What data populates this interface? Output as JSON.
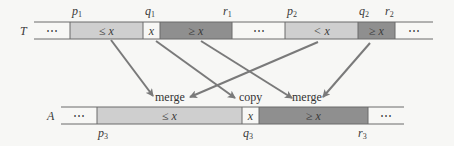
{
  "diagram": {
    "top_array": {
      "name": "T",
      "cells": [
        {
          "label": "⋯",
          "fill": "#f7f7f5",
          "x0": 34,
          "x1": 70
        },
        {
          "label": "≤ x",
          "fill": "#cfcfcf",
          "x0": 70,
          "x1": 143
        },
        {
          "label": "x",
          "fill": "#f7f7f5",
          "x0": 143,
          "x1": 160
        },
        {
          "label": "≥ x",
          "fill": "#8f8f8f",
          "x0": 160,
          "x1": 232
        },
        {
          "label": "⋯",
          "fill": "#f7f7f5",
          "x0": 232,
          "x1": 285
        },
        {
          "label": "< x",
          "fill": "#cfcfcf",
          "x0": 285,
          "x1": 358
        },
        {
          "label": "≥ x",
          "fill": "#8f8f8f",
          "x0": 358,
          "x1": 395
        },
        {
          "label": "⋯",
          "fill": "#f7f7f5",
          "x0": 395,
          "x1": 433
        }
      ],
      "indices": [
        {
          "base": "p",
          "sub": "1",
          "x": 72
        },
        {
          "base": "q",
          "sub": "1",
          "x": 145
        },
        {
          "base": "r",
          "sub": "1",
          "x": 223
        },
        {
          "base": "p",
          "sub": "2",
          "x": 287
        },
        {
          "base": "q",
          "sub": "2",
          "x": 359
        },
        {
          "base": "r",
          "sub": "2",
          "x": 385
        }
      ]
    },
    "bottom_array": {
      "name": "A",
      "cells": [
        {
          "label": "⋯",
          "fill": "#f7f7f5",
          "x0": 61,
          "x1": 97
        },
        {
          "label": "≤ x",
          "fill": "#cfcfcf",
          "x0": 97,
          "x1": 242
        },
        {
          "label": "x",
          "fill": "#f7f7f5",
          "x0": 242,
          "x1": 259
        },
        {
          "label": "≥ x",
          "fill": "#8f8f8f",
          "x0": 259,
          "x1": 368
        },
        {
          "label": "⋯",
          "fill": "#f7f7f5",
          "x0": 368,
          "x1": 404
        }
      ],
      "indices": [
        {
          "base": "p",
          "sub": "3",
          "x": 98
        },
        {
          "base": "q",
          "sub": "3",
          "x": 243
        },
        {
          "base": "r",
          "sub": "3",
          "x": 358
        }
      ]
    },
    "operations": [
      {
        "label": "merge",
        "x": 155,
        "y": 101
      },
      {
        "label": "copy",
        "x": 239,
        "y": 101
      },
      {
        "label": "merge",
        "x": 292,
        "y": 101
      }
    ],
    "arrows": [
      {
        "from": [
          111,
          40
        ],
        "to": [
          153,
          96
        ]
      },
      {
        "from": [
          156,
          41
        ],
        "to": [
          235,
          98
        ]
      },
      {
        "from": [
          201,
          41
        ],
        "to": [
          292,
          98
        ]
      },
      {
        "from": [
          318,
          42
        ],
        "to": [
          190,
          97
        ]
      },
      {
        "from": [
          370,
          43
        ],
        "to": [
          323,
          97
        ]
      }
    ],
    "colors": {
      "light": "#cfcfcf",
      "dark": "#8f8f8f",
      "line": "#6a6a6a",
      "arrow": "#7a7a7a"
    }
  }
}
